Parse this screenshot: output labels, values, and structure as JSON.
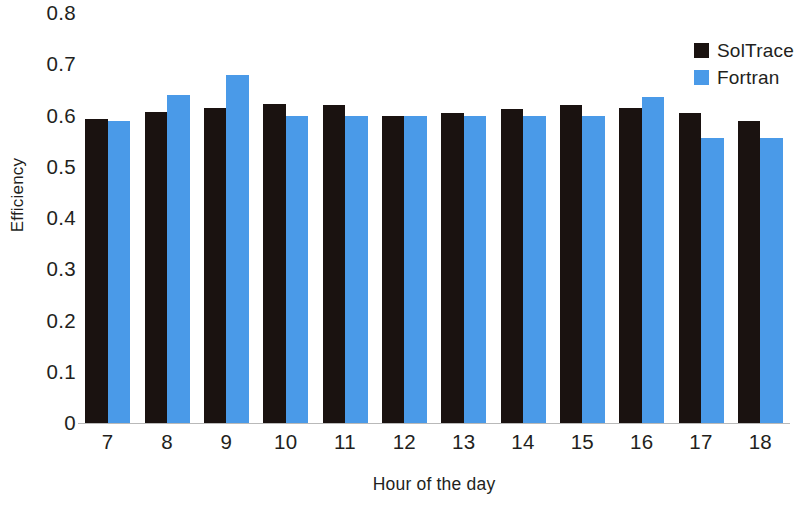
{
  "chart_data": {
    "type": "bar",
    "title": "",
    "subtitle": "",
    "xlabel": "Hour of the day",
    "ylabel": "Efficiency",
    "categories": [
      "7",
      "8",
      "9",
      "10",
      "11",
      "12",
      "13",
      "14",
      "15",
      "16",
      "17",
      "18"
    ],
    "series": [
      {
        "name": "SolTrace",
        "color": "#1a1210",
        "values": [
          0.593,
          0.607,
          0.615,
          0.622,
          0.62,
          0.6,
          0.605,
          0.613,
          0.62,
          0.615,
          0.605,
          0.59
        ]
      },
      {
        "name": "Fortran",
        "color": "#4a9ae8",
        "values": [
          0.59,
          0.64,
          0.68,
          0.6,
          0.6,
          0.6,
          0.6,
          0.6,
          0.6,
          0.637,
          0.557,
          0.557
        ]
      }
    ],
    "ylim": [
      0,
      0.8
    ],
    "ytick_labels": [
      "0.8",
      "0.7",
      "0.6",
      "0.5",
      "0.4",
      "0.3",
      "0.2",
      "0.1",
      "0"
    ],
    "ytick_values": [
      0.8,
      0.7,
      0.6,
      0.5,
      0.4,
      0.3,
      0.2,
      0.1,
      0
    ],
    "grid": false,
    "legend_position": "top-right",
    "bar_style": "grouped"
  },
  "legend": {
    "entries": [
      {
        "label": "SolTrace",
        "color": "#1a1210"
      },
      {
        "label": "Fortran",
        "color": "#4a9ae8"
      }
    ]
  },
  "axes": {
    "y_title": "Efficiency",
    "x_title": "Hour of the day"
  }
}
